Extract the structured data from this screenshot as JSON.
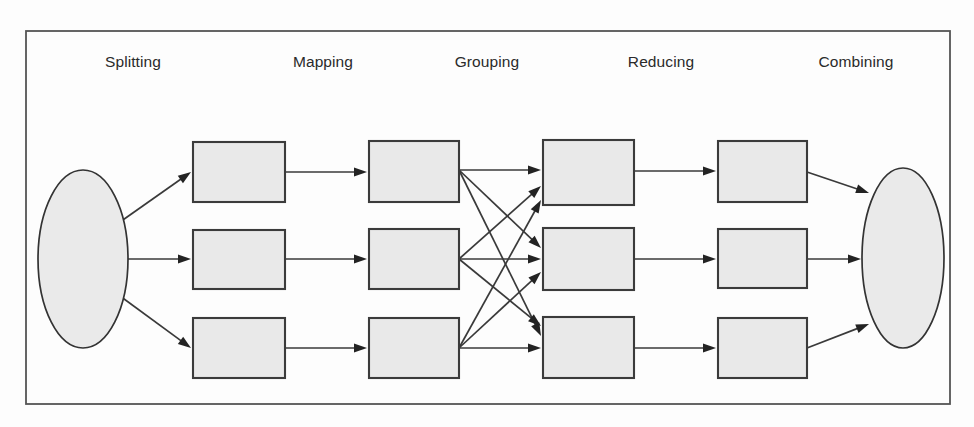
{
  "figure": {
    "background_color": "#fdfdfd",
    "frame": {
      "x": 26,
      "y": 31,
      "width": 924,
      "height": 373,
      "stroke": "#555555"
    }
  },
  "stage_labels": [
    {
      "name": "splitting",
      "text": "Splitting",
      "x": 133,
      "y": 67
    },
    {
      "name": "mapping",
      "text": "Mapping",
      "x": 323,
      "y": 67
    },
    {
      "name": "grouping",
      "text": "Grouping",
      "x": 487,
      "y": 67
    },
    {
      "name": "reducing",
      "text": "Reducing",
      "x": 661,
      "y": 67
    },
    {
      "name": "combining",
      "text": "Combining",
      "x": 856,
      "y": 67
    }
  ],
  "nodes": {
    "input_ellipse": {
      "name": "input-data-ellipse",
      "cx": 83,
      "cy": 259,
      "rx": 45,
      "ry": 89
    },
    "output_ellipse": {
      "name": "output-data-ellipse",
      "cx": 903,
      "cy": 258,
      "rx": 41,
      "ry": 90
    },
    "split_boxes": [
      {
        "name": "split-box-1",
        "x": 193,
        "y": 142,
        "width": 92,
        "height": 60
      },
      {
        "name": "split-box-2",
        "x": 193,
        "y": 230,
        "width": 92,
        "height": 59
      },
      {
        "name": "split-box-3",
        "x": 193,
        "y": 318,
        "width": 92,
        "height": 60
      }
    ],
    "map_boxes": [
      {
        "name": "map-box-1",
        "x": 369,
        "y": 141,
        "width": 90,
        "height": 61
      },
      {
        "name": "map-box-2",
        "x": 369,
        "y": 229,
        "width": 90,
        "height": 60
      },
      {
        "name": "map-box-3",
        "x": 369,
        "y": 318,
        "width": 90,
        "height": 60
      }
    ],
    "group_boxes": [
      {
        "name": "group-box-1",
        "x": 543,
        "y": 140,
        "width": 91,
        "height": 65
      },
      {
        "name": "group-box-2",
        "x": 543,
        "y": 228,
        "width": 91,
        "height": 62
      },
      {
        "name": "group-box-3",
        "x": 543,
        "y": 317,
        "width": 91,
        "height": 61
      }
    ],
    "reduce_boxes": [
      {
        "name": "reduce-box-1",
        "x": 718,
        "y": 141,
        "width": 89,
        "height": 61
      },
      {
        "name": "reduce-box-2",
        "x": 718,
        "y": 229,
        "width": 89,
        "height": 59
      },
      {
        "name": "reduce-box-3",
        "x": 718,
        "y": 318,
        "width": 89,
        "height": 60
      }
    ]
  },
  "edges": {
    "input_to_split": [
      {
        "name": "edge-input-to-split-1",
        "x1": 120,
        "y1": 222,
        "x2": 191,
        "y2": 172
      },
      {
        "name": "edge-input-to-split-2",
        "x1": 128,
        "y1": 259,
        "x2": 191,
        "y2": 259
      },
      {
        "name": "edge-input-to-split-3",
        "x1": 120,
        "y1": 296,
        "x2": 191,
        "y2": 348
      }
    ],
    "split_to_map": [
      {
        "name": "edge-split-to-map-1",
        "x1": 285,
        "y1": 172,
        "x2": 367,
        "y2": 172
      },
      {
        "name": "edge-split-to-map-2",
        "x1": 285,
        "y1": 259,
        "x2": 367,
        "y2": 259
      },
      {
        "name": "edge-split-to-map-3",
        "x1": 285,
        "y1": 348,
        "x2": 367,
        "y2": 348
      }
    ],
    "map_to_group": [
      {
        "name": "edge-map1-to-group1",
        "x1": 459,
        "y1": 170,
        "x2": 541,
        "y2": 170
      },
      {
        "name": "edge-map1-to-group2",
        "x1": 459,
        "y1": 170,
        "x2": 541,
        "y2": 248
      },
      {
        "name": "edge-map1-to-group3",
        "x1": 459,
        "y1": 170,
        "x2": 541,
        "y2": 336
      },
      {
        "name": "edge-map2-to-group1",
        "x1": 459,
        "y1": 259,
        "x2": 541,
        "y2": 186
      },
      {
        "name": "edge-map2-to-group2",
        "x1": 459,
        "y1": 259,
        "x2": 541,
        "y2": 259
      },
      {
        "name": "edge-map2-to-group3",
        "x1": 459,
        "y1": 259,
        "x2": 541,
        "y2": 326
      },
      {
        "name": "edge-map3-to-group1",
        "x1": 459,
        "y1": 348,
        "x2": 541,
        "y2": 200
      },
      {
        "name": "edge-map3-to-group2",
        "x1": 459,
        "y1": 348,
        "x2": 541,
        "y2": 272
      },
      {
        "name": "edge-map3-to-group3",
        "x1": 459,
        "y1": 348,
        "x2": 541,
        "y2": 348
      }
    ],
    "group_to_reduce": [
      {
        "name": "edge-group-to-reduce-1",
        "x1": 634,
        "y1": 171,
        "x2": 716,
        "y2": 171
      },
      {
        "name": "edge-group-to-reduce-2",
        "x1": 634,
        "y1": 259,
        "x2": 716,
        "y2": 259
      },
      {
        "name": "edge-group-to-reduce-3",
        "x1": 634,
        "y1": 348,
        "x2": 716,
        "y2": 348
      }
    ],
    "reduce_to_output": [
      {
        "name": "edge-reduce-to-output-1",
        "x1": 807,
        "y1": 172,
        "x2": 869,
        "y2": 193
      },
      {
        "name": "edge-reduce-to-output-2",
        "x1": 807,
        "y1": 259,
        "x2": 861,
        "y2": 259
      },
      {
        "name": "edge-reduce-to-output-3",
        "x1": 807,
        "y1": 348,
        "x2": 869,
        "y2": 324
      }
    ]
  },
  "style": {
    "box_fill": "#e9e9e9",
    "box_stroke": "#3b3b3b",
    "ellipse_fill": "#eaeaea",
    "ellipse_stroke": "#333333",
    "line_stroke": "#3a3a3a",
    "arrow_fill": "#232323",
    "label_color": "#2a2a2a"
  }
}
